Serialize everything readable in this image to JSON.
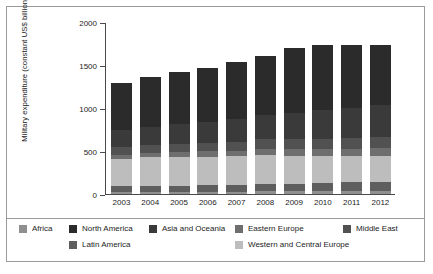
{
  "chart_data": {
    "type": "bar",
    "subtype": "stacked-bar",
    "title": "",
    "xlabel": "",
    "ylabel": "Military expenditure (constant US$ billion)",
    "ylim": [
      0,
      2000
    ],
    "ytick_labels": [
      "0",
      "500",
      "1000",
      "1500",
      "2000"
    ],
    "ytick_values": [
      0,
      500,
      1000,
      1500,
      2000
    ],
    "grid": false,
    "legend_position": "bottom",
    "categories": [
      "2003",
      "2004",
      "2005",
      "2006",
      "2007",
      "2008",
      "2009",
      "2010",
      "2011",
      "2012"
    ],
    "series": [
      {
        "name": "Africa",
        "color": "#8f8f8f",
        "values": [
          20,
          22,
          24,
          26,
          28,
          30,
          32,
          34,
          36,
          38
        ]
      },
      {
        "name": "Latin America",
        "color": "#5e5e5e",
        "values": [
          72,
          73,
          75,
          80,
          82,
          85,
          90,
          95,
          98,
          100
        ]
      },
      {
        "name": "Western and Central Europe",
        "color": "#bdbdbd",
        "values": [
          320,
          330,
          330,
          330,
          330,
          335,
          325,
          315,
          305,
          300
        ]
      },
      {
        "name": "Eastern Europe",
        "color": "#6e6e6e",
        "values": [
          45,
          50,
          55,
          60,
          65,
          75,
          75,
          80,
          85,
          95
        ]
      },
      {
        "name": "Middle East",
        "color": "#515151",
        "values": [
          85,
          90,
          95,
          100,
          105,
          110,
          115,
          120,
          125,
          130
        ]
      },
      {
        "name": "Asia and Oceania",
        "color": "#3a3a3a",
        "values": [
          205,
          215,
          230,
          245,
          265,
          285,
          310,
          330,
          350,
          370
        ]
      },
      {
        "name": "North America",
        "color": "#2b2b2b",
        "values": [
          540,
          585,
          615,
          630,
          655,
          690,
          755,
          760,
          735,
          695
        ]
      }
    ],
    "totals": [
      1287,
      1365,
      1424,
      1471,
      1530,
      1610,
      1702,
      1734,
      1734,
      1728
    ]
  },
  "legend": {
    "rows": [
      [
        {
          "label": "Africa",
          "color": "#8f8f8f",
          "x": 12
        },
        {
          "label": "North America",
          "color": "#2b2b2b",
          "x": 62
        },
        {
          "label": "Asia and Oceania",
          "color": "#3a3a3a",
          "x": 142
        },
        {
          "label": "Eastern Europe",
          "color": "#6e6e6e",
          "x": 228
        },
        {
          "label": "Middle East",
          "color": "#515151",
          "x": 336
        }
      ],
      [
        {
          "label": "Latin America",
          "color": "#5e5e5e",
          "x": 62
        },
        {
          "label": "Western and Central Europe",
          "color": "#bdbdbd",
          "x": 228
        }
      ]
    ]
  },
  "style": {
    "frame_border": "#9a9a9a",
    "axis_color": "#4a4a4a",
    "text_color": "#1c1c1c",
    "background": "#ffffff"
  }
}
